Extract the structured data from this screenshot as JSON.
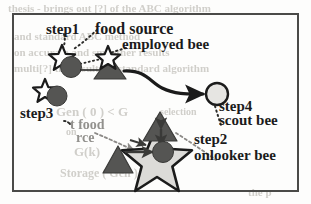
{
  "figure": {
    "type": "diagram",
    "border_color": "#4a4a48",
    "background_color": "#fdfdfc"
  },
  "labels": {
    "step1": "step1",
    "step2": "step2",
    "step3": "step3",
    "step4": "step4",
    "food_source": "food source",
    "employed_bee": "employed bee",
    "scout_bee": "scout bee",
    "onlooker_bee": "onlooker bee",
    "best_food_line1": "t food",
    "best_food_line2": "rce"
  },
  "ghost_text": [
    {
      "text": "thesis - brings out [?] of the ABC algorithm",
      "x": 8,
      "y": 2,
      "size": 11
    },
    {
      "text": "and standard ABC method",
      "x": 14,
      "y": 30,
      "size": 11
    },
    {
      "text": "on accurate and smoother results",
      "x": 14,
      "y": 46,
      "size": 11
    },
    {
      "text": "multi[?] the results of standard algorithm",
      "x": 14,
      "y": 62,
      "size": 11
    },
    {
      "text": "Gen ( 0 ) < G",
      "x": 56,
      "y": 104,
      "size": 13
    },
    {
      "text": "selection",
      "x": 160,
      "y": 106,
      "size": 10
    },
    {
      "text": "on",
      "x": 66,
      "y": 126,
      "size": 10
    },
    {
      "text": "G(k)",
      "x": 74,
      "y": 144,
      "size": 13
    },
    {
      "text": "Storage ( Gen )",
      "x": 60,
      "y": 166,
      "size": 12
    },
    {
      "text": "the p",
      "x": 248,
      "y": 186,
      "size": 11
    }
  ],
  "shapes": {
    "colors": {
      "dark_fill": "#555553",
      "mid_fill": "#6d6b68",
      "light_fill": "#d6d5d2",
      "outline": "#1b1b1b",
      "line": "#1b1b1b",
      "dotted_leader": "#2a2a28"
    },
    "nodes": [
      {
        "name": "step1-food-source-star",
        "kind": "star-outline",
        "cx": 62,
        "cy": 57,
        "r": 12
      },
      {
        "name": "step1-employed-bee-circle",
        "kind": "circle-dark",
        "cx": 71,
        "cy": 67,
        "r": 10
      },
      {
        "name": "mid-food-source-star",
        "kind": "star-outline",
        "cx": 107,
        "cy": 57,
        "r": 11
      },
      {
        "name": "mid-employed-bee-triangle",
        "kind": "triangle-dark",
        "cx": 110,
        "cy": 68,
        "w": 28,
        "h": 22
      },
      {
        "name": "step4-scout-bee-circle",
        "kind": "circle-light",
        "cx": 217,
        "cy": 94,
        "r": 11
      },
      {
        "name": "step3-food-source-star",
        "kind": "star-outline",
        "cx": 45,
        "cy": 90,
        "r": 11
      },
      {
        "name": "step3-bee-circle",
        "kind": "circle-dark",
        "cx": 57,
        "cy": 96,
        "r": 10
      },
      {
        "name": "step2-big-star",
        "kind": "star-light",
        "cx": 157,
        "cy": 157,
        "r": 32
      },
      {
        "name": "step2-onlooker-bee-circle",
        "kind": "circle-dark",
        "cx": 163,
        "cy": 152,
        "r": 10
      },
      {
        "name": "step2-top-triangle",
        "kind": "triangle-dark",
        "cx": 160,
        "cy": 126,
        "w": 34,
        "h": 28
      },
      {
        "name": "step2-left-triangle",
        "kind": "triangle-dark",
        "cx": 118,
        "cy": 160,
        "w": 30,
        "h": 26
      }
    ]
  }
}
